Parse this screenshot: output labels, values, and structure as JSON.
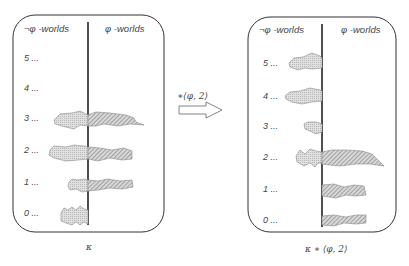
{
  "left_panel": {
    "header_left": "¬φ -worlds",
    "header_right": "φ -worlds",
    "rows": [
      "5 ...",
      "4 ...",
      "3 ...",
      "2 ...",
      "1 ...",
      "0 ..."
    ],
    "caption": "κ"
  },
  "operator": {
    "label": "∗⟨φ, 2⟩"
  },
  "right_panel": {
    "header_left": "¬φ -worlds",
    "header_right": "φ -worlds",
    "rows": [
      "5 ...",
      "4 ...",
      "3 ...",
      "2 ...",
      "1 ...",
      "0 ..."
    ],
    "caption": "κ ∗ ⟨φ, 2⟩"
  },
  "colors": {
    "box_stroke": "#333333",
    "blob_fill": "#d4d4d4",
    "hatch": "#777777"
  }
}
